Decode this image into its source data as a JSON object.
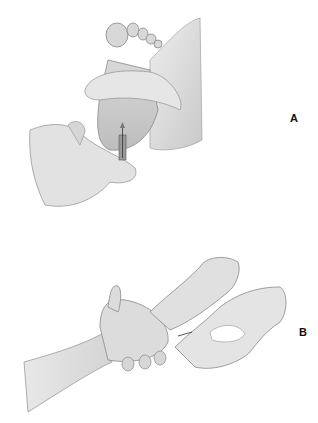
{
  "figure": {
    "panels": [
      {
        "id": "A",
        "label": "A",
        "description": "Gloved hands holding an infant's heel while a lancet punctures the heel"
      },
      {
        "id": "B",
        "label": "B",
        "description": "Gloved hands holding a patient's hand/finger while performing a finger stick"
      }
    ],
    "colors": {
      "background": "#ffffff",
      "skin_fill": "#e4e4e4",
      "glove_fill": "#dcdcdc",
      "shadow": "#bdbdbd",
      "outline": "#8a8a8a",
      "label": "#111111"
    }
  }
}
